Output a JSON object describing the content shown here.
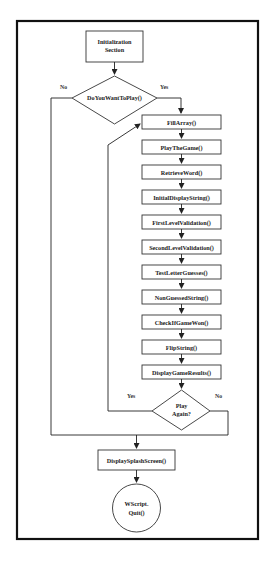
{
  "diagram": {
    "type": "flowchart",
    "start": {
      "line1": "Initialization",
      "line2": "Section"
    },
    "decision_play": {
      "label": "DoYouWantToPlay()",
      "yes": "Yes",
      "no": "No"
    },
    "steps": [
      "FillArray()",
      "PlayTheGame()",
      "RetrieveWord()",
      "InitialDisplayString()",
      "FirstLevelValidation()",
      "SecondLevelValidation()",
      "TestLetterGuesses()",
      "NonGuessedString()",
      "CheckIfGameWon()",
      "FlipString()",
      "DisplayGameResults()"
    ],
    "decision_again": {
      "line1": "Play",
      "line2": "Again?",
      "yes": "Yes",
      "no": "No"
    },
    "splash": "DisplaySplashScreen()",
    "end": {
      "line1": "WScript.",
      "line2": "Quit()"
    },
    "colors": {
      "stroke": "#222222",
      "frame": "#111111",
      "background": "#ffffff"
    }
  }
}
